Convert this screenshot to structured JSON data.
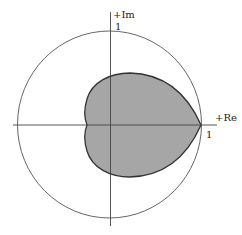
{
  "diagram": {
    "type": "complex-plane-stability-region",
    "axes": {
      "real_label": "+Re",
      "imag_label": "+Im",
      "real_tick_label": "1",
      "imag_tick_label": "1"
    },
    "unit_circle": {
      "radius": 1
    },
    "region": {
      "shape": "heart/cardioid",
      "fill_color": "#a6a6a6",
      "stroke_color": "#333333",
      "cusp_at": "1"
    },
    "colors": {
      "axis": "#444444",
      "circle": "#555555",
      "background": "#ffffff"
    }
  }
}
